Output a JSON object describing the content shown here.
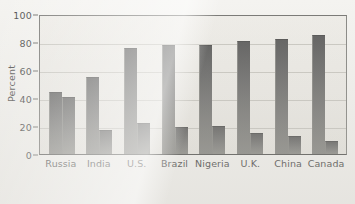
{
  "chart_data": {
    "type": "bar",
    "title": "",
    "subtitle": "",
    "xlabel": "",
    "ylabel": "Percent",
    "ylim": [
      0,
      100
    ],
    "yticks": [
      0,
      20,
      40,
      60,
      80,
      100
    ],
    "ytick_labels": [
      "0",
      "20",
      "40",
      "60",
      "80",
      "100"
    ],
    "grid": true,
    "legend": "none",
    "categories": [
      "Russia",
      "India",
      "U.S.",
      "Brazil",
      "Nigeria",
      "U.K.",
      "China",
      "Canada"
    ],
    "series": [
      {
        "name": "Series 1",
        "values": [
          44,
          55,
          76,
          78,
          78,
          81,
          82,
          85
        ]
      },
      {
        "name": "Series 2",
        "values": [
          41,
          17,
          22,
          19,
          20,
          15,
          13,
          9
        ]
      }
    ]
  },
  "axis": {
    "y_label": "Percent"
  }
}
